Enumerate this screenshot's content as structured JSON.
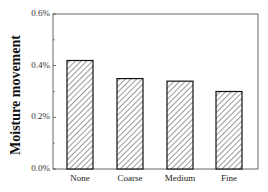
{
  "chart_data": {
    "type": "bar",
    "title": "",
    "xlabel": "",
    "ylabel": "Moisture movement",
    "categories": [
      "None",
      "Coarse",
      "Medium",
      "Fine"
    ],
    "values": [
      0.42,
      0.35,
      0.34,
      0.3
    ],
    "value_unit": "%",
    "ylim": [
      0,
      0.6
    ],
    "yticks": [
      "0.0%",
      "0.2%",
      "0.4%",
      "0.6%"
    ],
    "grid": false,
    "legend": null,
    "bar_style": {
      "fill": "hatched",
      "hatch_color": "#555555",
      "edge_color": "#111111"
    }
  }
}
